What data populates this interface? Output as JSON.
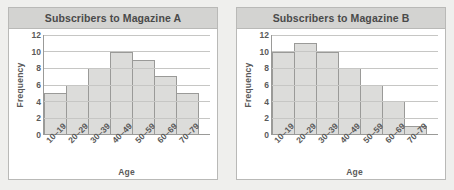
{
  "page": {
    "background_color": "#efefed"
  },
  "colors": {
    "panel_background": "#ffffff",
    "panel_border": "#b9b9b7",
    "title_band": "#d3d3d1",
    "title_text": "#4a4a4a",
    "bar_fill": "#dcdcda",
    "bar_border": "#9a9a98",
    "axis": "#9a9a98",
    "gridline": "#c6c6c4",
    "tick_text": "#5a5a5a"
  },
  "panels": [
    {
      "title": "Subscribers to Magazine A",
      "chart_ref": 0
    },
    {
      "title": "Subscribers to Magazine B",
      "chart_ref": 1
    }
  ],
  "chart_data": [
    {
      "type": "bar",
      "title": "Subscribers to Magazine A",
      "categories": [
        "10–19",
        "20–29",
        "30–39",
        "40–49",
        "50–59",
        "60–69",
        "70–79"
      ],
      "values": [
        5,
        6,
        8,
        10,
        9,
        7,
        5
      ],
      "xlabel": "Age",
      "ylabel": "Frequency",
      "ylim": [
        0,
        12
      ],
      "yticks": [
        0,
        2,
        4,
        6,
        8,
        10,
        12
      ],
      "grid": "horizontal",
      "legend": "none",
      "bar_style": "histogram-adjacent"
    },
    {
      "type": "bar",
      "title": "Subscribers to Magazine B",
      "categories": [
        "10–19",
        "20–29",
        "30–39",
        "40–49",
        "50–59",
        "60–69",
        "70–79"
      ],
      "values": [
        10,
        11,
        10,
        8,
        6,
        4,
        1
      ],
      "xlabel": "Age",
      "ylabel": "Frequency",
      "ylim": [
        0,
        12
      ],
      "yticks": [
        0,
        2,
        4,
        6,
        8,
        10,
        12
      ],
      "grid": "horizontal",
      "legend": "none",
      "bar_style": "histogram-adjacent"
    }
  ]
}
